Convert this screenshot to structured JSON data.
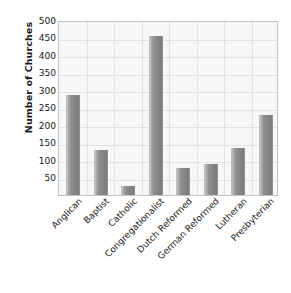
{
  "chart_data": {
    "type": "bar",
    "title": "",
    "subtitle": "",
    "xlabel": "",
    "ylabel": "Number of Churches",
    "ylim": [
      0,
      500
    ],
    "ytick_labels": [
      "500",
      "450",
      "400",
      "350",
      "300",
      "250",
      "200",
      "150",
      "100",
      "50"
    ],
    "ytick_values": [
      500,
      450,
      400,
      350,
      300,
      250,
      200,
      150,
      100,
      50
    ],
    "grid": true,
    "legend": false,
    "legend_position": "none",
    "categories": [
      "Anglican",
      "Baptist",
      "Catholic",
      "Congregationalist",
      "Dutch Reformed",
      "German Reformed",
      "Lutheran",
      "Presbyterian"
    ],
    "values": [
      287,
      130,
      27,
      453,
      77,
      88,
      135,
      230
    ],
    "bar_color": "#878787",
    "plot_background": "#f7f7f7",
    "gridline_color": "#e2e2e2",
    "axis_border_color": "#c2c2c2",
    "text_color": "#1a1a1a"
  }
}
